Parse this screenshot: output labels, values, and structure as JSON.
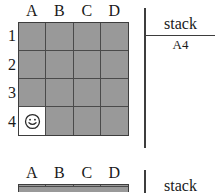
{
  "figures": [
    {
      "grid": {
        "column_headers": [
          "A",
          "B",
          "C",
          "D"
        ],
        "row_labels": [
          "1",
          "2",
          "3",
          "4"
        ],
        "rows": 4,
        "columns": 4,
        "cell_color": "#999999",
        "gridline_color": "#4a4a4a",
        "border_color": "#3d3d3d",
        "occupied_cell_color": "#ffffff",
        "token": {
          "icon": "smiley-face-icon",
          "cell": "A4",
          "row_index": 3,
          "column_index": 0
        },
        "clipped": false
      },
      "stack": {
        "title": "stack",
        "items": [
          "A4"
        ]
      }
    },
    {
      "grid": {
        "column_headers": [
          "A",
          "B",
          "C",
          "D"
        ],
        "row_labels": [
          "1",
          "2",
          "3",
          "4"
        ],
        "rows": 4,
        "columns": 4,
        "cell_color": "#999999",
        "gridline_color": "#4a4a4a",
        "border_color": "#3d3d3d",
        "occupied_cell_color": "#ffffff",
        "token": null,
        "clipped": true
      },
      "stack": {
        "title": "stack",
        "items": []
      }
    }
  ]
}
